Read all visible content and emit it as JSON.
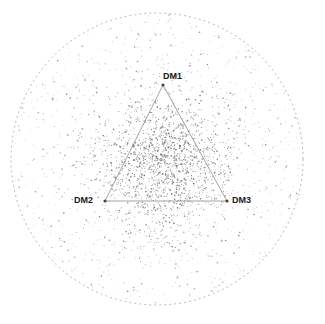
{
  "figure": {
    "type": "simplex-scatter",
    "background_color": "#ffffff",
    "width": 325,
    "height": 324
  },
  "boundary": {
    "name": "unit-circle",
    "style": "dashed",
    "color": "#9a9a9a",
    "center_x": 157,
    "center_y": 159,
    "radius": 146,
    "dash": "2 3",
    "stroke_width": 0.7
  },
  "simplex": {
    "edge_color": "#8c8c8c",
    "edge_width": 0.8,
    "vertex_marker_color": "#444444",
    "vertex_marker_radius": 1.6,
    "vertices": [
      {
        "id": "DM1",
        "label": "DM1",
        "x": 163,
        "y": 85
      },
      {
        "id": "DM2",
        "label": "DM2",
        "x": 105,
        "y": 201
      },
      {
        "id": "DM3",
        "label": "DM3",
        "x": 227,
        "y": 201
      }
    ],
    "edges": [
      {
        "from": "DM1",
        "to": "DM2"
      },
      {
        "from": "DM1",
        "to": "DM3"
      },
      {
        "from": "DM2",
        "to": "DM3"
      }
    ]
  },
  "chart_data": {
    "type": "scatter",
    "title": "",
    "xlabel": "",
    "ylabel": "",
    "grid": false,
    "legend": "none",
    "point_color": "#8a8a8a",
    "point_size": 0.9,
    "point_marker": "dot",
    "point_count": 2400,
    "distribution": "radially decaying density inside circle, concentrated near simplex centroid",
    "annotations": [
      "DM1",
      "DM2",
      "DM3"
    ],
    "xlim": [
      11,
      303
    ],
    "ylim": [
      13,
      305
    ]
  }
}
